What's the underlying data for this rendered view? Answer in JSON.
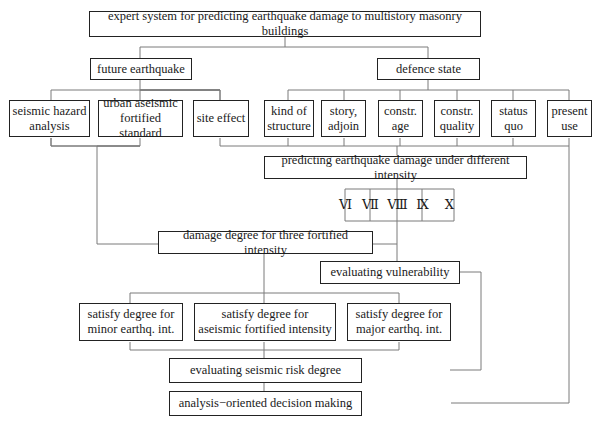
{
  "diagram": {
    "root": "expert system for predicting earthquake damage to multistory masonry buildings",
    "branches": {
      "future_earthquake": {
        "label": "future earthquake",
        "children": [
          "seismic hazard analysis",
          "urban aseismic fortified standard",
          "site effect"
        ]
      },
      "defence_state": {
        "label": "defence state",
        "children": [
          "kind of structure",
          "story, adjoin",
          "constr. age",
          "constr. quality",
          "status quo",
          "present use"
        ]
      }
    },
    "nodes": {
      "seismic_hazard": [
        "seismic hazard",
        "analysis"
      ],
      "urban_standard": [
        "urban aseismic",
        "fortified standard"
      ],
      "site_effect": [
        "site effect"
      ],
      "kind_structure": [
        "kind of",
        "structure"
      ],
      "story_adjoin": [
        "story,",
        "adjoin"
      ],
      "constr_age": [
        "constr.",
        "age"
      ],
      "constr_quality": [
        "constr.",
        "quality"
      ],
      "status_quo": [
        "status",
        "quo"
      ],
      "present_use": [
        "present",
        "use"
      ],
      "predicting": "predicting earthquake damage under different intensity",
      "intensities": [
        "Ⅵ",
        "Ⅶ",
        "Ⅷ",
        "Ⅸ",
        "Ⅹ"
      ],
      "damage_degree": "damage degree for three fortified intensity",
      "vulnerability": "evaluating vulnerability",
      "satisfy_minor": [
        "satisfy degree for",
        "minor earthq. int."
      ],
      "satisfy_fortified": [
        "satisfy degree for",
        "aseismic fortified intensity"
      ],
      "satisfy_major": [
        "satisfy degree for",
        "major earthq. int."
      ],
      "risk": "evaluating seismic risk degree",
      "decision": "analysis−oriented decision making"
    }
  }
}
